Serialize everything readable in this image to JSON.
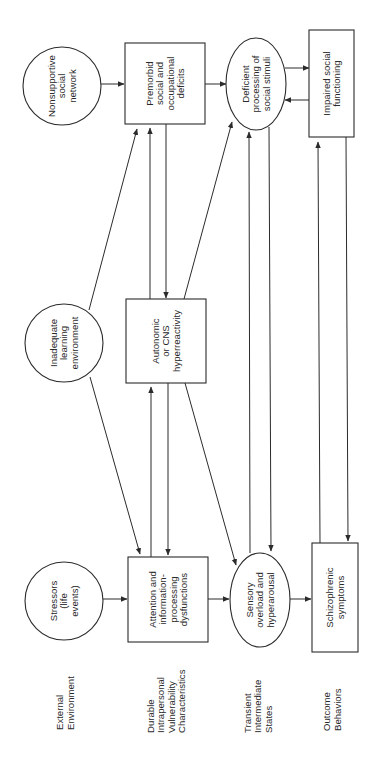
{
  "diagram": {
    "orientation": "rotated-90-ccw",
    "colors": {
      "line": "#2b2b2b",
      "text": "#2a2a2a",
      "background": "#ffffff"
    },
    "row_labels": [
      {
        "id": "external",
        "lines": [
          "External",
          "Environment"
        ],
        "x": 65,
        "y": 730
      },
      {
        "id": "durable",
        "lines": [
          "Durable",
          "Intrapersonal",
          "Vulnerability",
          "Characteristics"
        ],
        "x": 166,
        "y": 733
      },
      {
        "id": "transient",
        "lines": [
          "Transient",
          "Intermediate",
          "States"
        ],
        "x": 258,
        "y": 733
      },
      {
        "id": "outcome",
        "lines": [
          "Outcome",
          "Behaviors"
        ],
        "x": 332,
        "y": 731
      }
    ],
    "nodes": [
      {
        "id": "nonsupportive",
        "shape": "circle",
        "cx": 62,
        "cy": 86,
        "r": 39,
        "lines": [
          "Nonsupportive",
          "social",
          "network"
        ]
      },
      {
        "id": "premorbid",
        "shape": "rect",
        "x": 125,
        "y": 43,
        "w": 80,
        "h": 81,
        "lines": [
          "Premorbid",
          "social  and",
          "occupational",
          "deficits"
        ]
      },
      {
        "id": "deficient",
        "shape": "ellipse",
        "cx": 256,
        "cy": 84,
        "rx": 30,
        "ry": 46,
        "lines": [
          "Deficient",
          "processing of",
          "social stimuli"
        ]
      },
      {
        "id": "impaired",
        "shape": "rect",
        "x": 309,
        "y": 30,
        "w": 45,
        "h": 107,
        "lines": [
          "Impaired social",
          "functioning"
        ]
      },
      {
        "id": "inadequate",
        "shape": "circle",
        "cx": 64,
        "cy": 343,
        "r": 39,
        "lines": [
          "Inadequate",
          "learning",
          "environment"
        ]
      },
      {
        "id": "autonomic",
        "shape": "rect",
        "x": 126,
        "y": 299,
        "w": 80,
        "h": 84,
        "lines": [
          "Autonomic",
          "or CNS",
          "hyperreactivity"
        ]
      },
      {
        "id": "stressors",
        "shape": "circle",
        "cx": 64,
        "cy": 601,
        "r": 39,
        "lines": [
          "Stressors",
          "(life",
          "events)"
        ]
      },
      {
        "id": "attention",
        "shape": "rect",
        "x": 128,
        "y": 557,
        "w": 80,
        "h": 85,
        "lines": [
          "Attention and",
          "information-",
          "processing",
          "dysfunctions"
        ]
      },
      {
        "id": "sensory",
        "shape": "ellipse",
        "cx": 260,
        "cy": 600,
        "rx": 30,
        "ry": 47,
        "lines": [
          "Sensory",
          "overload and",
          "hyperarousal"
        ]
      },
      {
        "id": "schizophrenic",
        "shape": "rect",
        "x": 312,
        "y": 543,
        "w": 46,
        "h": 109,
        "lines": [
          "Schizophrenic",
          "symptoms"
        ]
      }
    ],
    "edges": [
      {
        "from": "nonsupportive",
        "to": "premorbid",
        "x1": 101,
        "y1": 84,
        "x2": 124,
        "y2": 84
      },
      {
        "from": "premorbid",
        "to": "deficient",
        "x1": 205,
        "y1": 84,
        "x2": 226,
        "y2": 84
      },
      {
        "from": "deficient",
        "to": "impaired",
        "x1": 285,
        "y1": 68,
        "x2": 309,
        "y2": 68
      },
      {
        "from": "impaired",
        "to": "deficient",
        "x1": 309,
        "y1": 100,
        "x2": 285,
        "y2": 100
      },
      {
        "from": "inadequate",
        "to": "premorbid",
        "x1": 89,
        "y1": 310,
        "x2": 137,
        "y2": 129
      },
      {
        "from": "autonomic",
        "to": "premorbid",
        "x1": 150,
        "y1": 299,
        "x2": 150,
        "y2": 128
      },
      {
        "from": "premorbid",
        "to": "autonomic",
        "x1": 166,
        "y1": 124,
        "x2": 166,
        "y2": 298
      },
      {
        "from": "autonomic",
        "to": "deficient",
        "x1": 184,
        "y1": 299,
        "x2": 232,
        "y2": 122
      },
      {
        "from": "sensory",
        "to": "deficient",
        "x1": 250,
        "y1": 553,
        "x2": 249,
        "y2": 132
      },
      {
        "from": "deficient",
        "to": "sensory",
        "x1": 269,
        "y1": 127,
        "x2": 271,
        "y2": 551
      },
      {
        "from": "schizophrenic",
        "to": "impaired",
        "x1": 320,
        "y1": 543,
        "x2": 318,
        "y2": 142
      },
      {
        "from": "impaired",
        "to": "schizophrenic",
        "x1": 346,
        "y1": 137,
        "x2": 348,
        "y2": 541
      },
      {
        "from": "inadequate",
        "to": "attention",
        "x1": 90,
        "y1": 377,
        "x2": 140,
        "y2": 554
      },
      {
        "from": "attention",
        "to": "autonomic",
        "x1": 151,
        "y1": 557,
        "x2": 151,
        "y2": 387
      },
      {
        "from": "autonomic",
        "to": "attention",
        "x1": 168,
        "y1": 383,
        "x2": 168,
        "y2": 555
      },
      {
        "from": "autonomic",
        "to": "sensory",
        "x1": 185,
        "y1": 383,
        "x2": 236,
        "y2": 565
      },
      {
        "from": "stressors",
        "to": "attention",
        "x1": 103,
        "y1": 599,
        "x2": 127,
        "y2": 599
      },
      {
        "from": "attention",
        "to": "sensory",
        "x1": 208,
        "y1": 599,
        "x2": 229,
        "y2": 599
      },
      {
        "from": "sensory",
        "to": "schizophrenic",
        "x1": 290,
        "y1": 599,
        "x2": 311,
        "y2": 599
      }
    ]
  }
}
